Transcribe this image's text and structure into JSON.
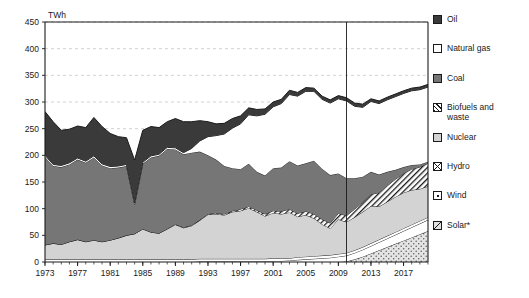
{
  "unit": "TWh",
  "divider_year": 2010,
  "legend": {
    "items": [
      {
        "label": "Oil",
        "icon": "oil-swatch",
        "color": "#3a3a3a"
      },
      {
        "label": "Natural gas",
        "icon": "gas-swatch",
        "color": "#ffffff"
      },
      {
        "label": "Coal",
        "icon": "coal-swatch",
        "color": "#767676"
      },
      {
        "label": "Biofuels and\nwaste",
        "icon": "biofuels-swatch",
        "color": "#ffffff"
      },
      {
        "label": "Nuclear",
        "icon": "nuclear-swatch",
        "color": "#d3d3d3"
      },
      {
        "label": "Hydro",
        "icon": "hydro-swatch",
        "color": "#ffffff"
      },
      {
        "label": "Wind",
        "icon": "wind-swatch",
        "color": "#ffffff"
      },
      {
        "label": "Solar*",
        "icon": "solar-swatch",
        "color": "#e2e2e2"
      }
    ]
  },
  "chart_data": {
    "type": "area",
    "stacked": true,
    "title": "",
    "xlabel": "",
    "ylabel": "TWh",
    "ylim": [
      0,
      450
    ],
    "ytick_step": 50,
    "yticks": [
      0,
      50,
      100,
      150,
      200,
      250,
      300,
      350,
      400,
      450
    ],
    "xlim": [
      1973,
      2020
    ],
    "xticks": [
      1973,
      1977,
      1981,
      1985,
      1989,
      1993,
      1997,
      2001,
      2005,
      2009,
      2013,
      2017
    ],
    "grid": "horizontal-dashed",
    "legend_position": "right",
    "annotations": [
      {
        "type": "vertical-line",
        "x": 2010,
        "note": "history / projection divider"
      }
    ],
    "footnote": "*",
    "x": [
      1973,
      1974,
      1975,
      1976,
      1977,
      1978,
      1979,
      1980,
      1981,
      1982,
      1983,
      1984,
      1985,
      1986,
      1987,
      1988,
      1989,
      1990,
      1991,
      1992,
      1993,
      1994,
      1995,
      1996,
      1997,
      1998,
      1999,
      2000,
      2001,
      2002,
      2003,
      2004,
      2005,
      2006,
      2007,
      2008,
      2009,
      2010,
      2011,
      2012,
      2013,
      2014,
      2015,
      2016,
      2017,
      2018,
      2019,
      2020
    ],
    "series": [
      {
        "name": "Solar*",
        "values": [
          0,
          0,
          0,
          0,
          0,
          0,
          0,
          0,
          0,
          0,
          0,
          0,
          0,
          0,
          0,
          0,
          0,
          0,
          0,
          0,
          0,
          0,
          0,
          0,
          0,
          0,
          0,
          0,
          0,
          0,
          0,
          0,
          0,
          0,
          0,
          0,
          0,
          1,
          5,
          10,
          16,
          22,
          28,
          34,
          40,
          46,
          52,
          58
        ]
      },
      {
        "name": "Wind",
        "values": [
          0,
          0,
          0,
          0,
          0,
          0,
          0,
          0,
          0,
          0,
          0,
          0,
          0,
          0,
          0,
          0,
          0,
          0,
          0,
          1,
          1,
          1,
          1,
          1,
          1,
          1,
          1,
          1,
          2,
          2,
          3,
          4,
          5,
          6,
          7,
          8,
          10,
          11,
          12,
          13,
          14,
          15,
          16,
          17,
          18,
          19,
          20,
          21
        ]
      },
      {
        "name": "Hydro",
        "values": [
          5,
          5,
          5,
          5,
          5,
          5,
          5,
          5,
          5,
          5,
          5,
          5,
          5,
          5,
          5,
          5,
          5,
          5,
          5,
          5,
          5,
          5,
          5,
          5,
          5,
          5,
          5,
          5,
          5,
          5,
          4,
          5,
          5,
          5,
          5,
          5,
          5,
          5,
          5,
          5,
          5,
          5,
          5,
          5,
          5,
          5,
          5,
          5
        ]
      },
      {
        "name": "Nuclear",
        "values": [
          27,
          30,
          28,
          33,
          37,
          33,
          36,
          33,
          36,
          40,
          45,
          48,
          57,
          51,
          49,
          57,
          65,
          59,
          63,
          72,
          83,
          84,
          82,
          88,
          90,
          95,
          88,
          80,
          85,
          83,
          86,
          76,
          78,
          71,
          59,
          50,
          65,
          58,
          62,
          66,
          70,
          62,
          64,
          66,
          67,
          65,
          60,
          58
        ]
      },
      {
        "name": "Biofuels and waste",
        "values": [
          0,
          0,
          0,
          0,
          0,
          0,
          0,
          0,
          0,
          0,
          0,
          0,
          0,
          0,
          0,
          0,
          1,
          1,
          1,
          1,
          1,
          2,
          2,
          2,
          3,
          3,
          3,
          4,
          4,
          5,
          6,
          6,
          7,
          8,
          9,
          10,
          11,
          12,
          15,
          18,
          22,
          26,
          30,
          33,
          36,
          39,
          41,
          43
        ]
      },
      {
        "name": "Coal",
        "values": [
          165,
          145,
          145,
          145,
          150,
          148,
          155,
          143,
          135,
          132,
          130,
          55,
          122,
          140,
          145,
          150,
          140,
          137,
          136,
          128,
          110,
          100,
          90,
          80,
          75,
          80,
          72,
          72,
          80,
          82,
          90,
          90,
          90,
          100,
          95,
          90,
          75,
          70,
          58,
          48,
          42,
          34,
          26,
          18,
          12,
          8,
          5,
          3
        ]
      },
      {
        "name": "Natural gas",
        "values": [
          3,
          3,
          3,
          3,
          3,
          3,
          3,
          3,
          3,
          3,
          3,
          3,
          3,
          3,
          3,
          3,
          3,
          3,
          8,
          20,
          35,
          45,
          60,
          75,
          85,
          92,
          105,
          115,
          115,
          120,
          125,
          130,
          135,
          130,
          130,
          135,
          140,
          145,
          135,
          130,
          132,
          133,
          135,
          137,
          138,
          139,
          140,
          140
        ]
      },
      {
        "name": "Oil",
        "values": [
          82,
          80,
          66,
          63,
          60,
          63,
          72,
          70,
          62,
          55,
          50,
          80,
          60,
          55,
          50,
          48,
          55,
          58,
          50,
          38,
          28,
          22,
          20,
          18,
          15,
          13,
          12,
          10,
          9,
          8,
          8,
          7,
          7,
          6,
          6,
          6,
          6,
          6,
          6,
          6,
          5,
          5,
          5,
          5,
          5,
          5,
          5,
          5
        ]
      }
    ]
  }
}
